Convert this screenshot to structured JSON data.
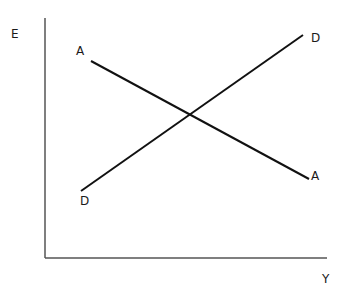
{
  "diagram": {
    "type": "line",
    "axes": {
      "y_label": "E",
      "x_label": "Y",
      "color": "#555555"
    },
    "lines": [
      {
        "name": "A",
        "start_label": "A",
        "end_label": "A",
        "slope": "downward",
        "color": "#111111"
      },
      {
        "name": "D",
        "start_label": "D",
        "end_label": "D",
        "slope": "upward",
        "color": "#111111"
      }
    ]
  }
}
